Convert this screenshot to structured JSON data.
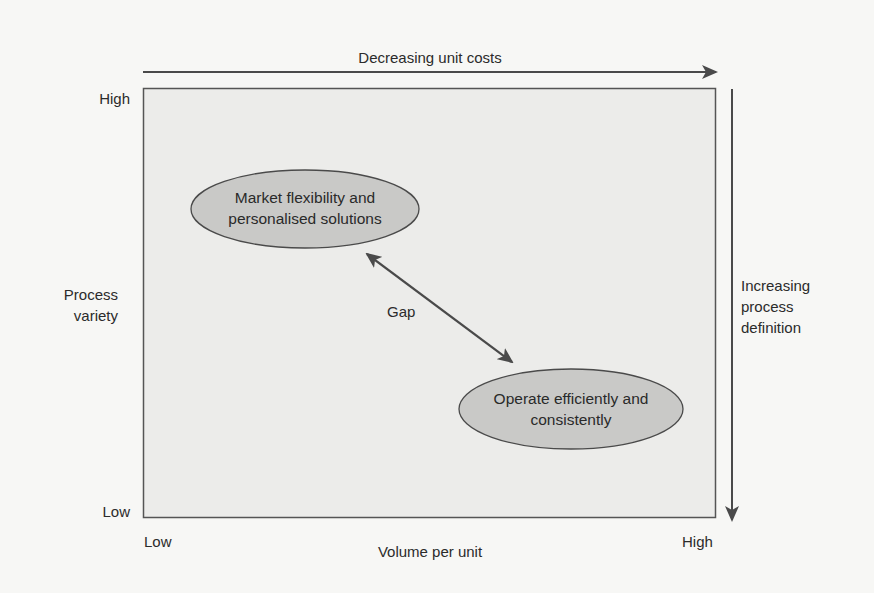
{
  "diagram": {
    "top_arrow_label": "Decreasing unit costs",
    "right_arrow_label_lines": [
      "Increasing",
      "process",
      "definition"
    ],
    "y_axis": {
      "label_lines": [
        "Process",
        "variety"
      ],
      "high": "High",
      "low": "Low"
    },
    "x_axis": {
      "label": "Volume per unit",
      "low": "Low",
      "high": "High"
    },
    "ellipses": [
      {
        "id": "market-flexibility",
        "lines": [
          "Market flexibility and",
          "personalised solutions"
        ]
      },
      {
        "id": "operate-efficiently",
        "lines": [
          "Operate efficiently and",
          "consistently"
        ]
      }
    ],
    "gap_label": "Gap",
    "colors": {
      "background": "#f7f7f5",
      "box_fill": "#ececea",
      "ellipse_fill": "#c9c9c7",
      "stroke": "#4a4a4a"
    }
  }
}
